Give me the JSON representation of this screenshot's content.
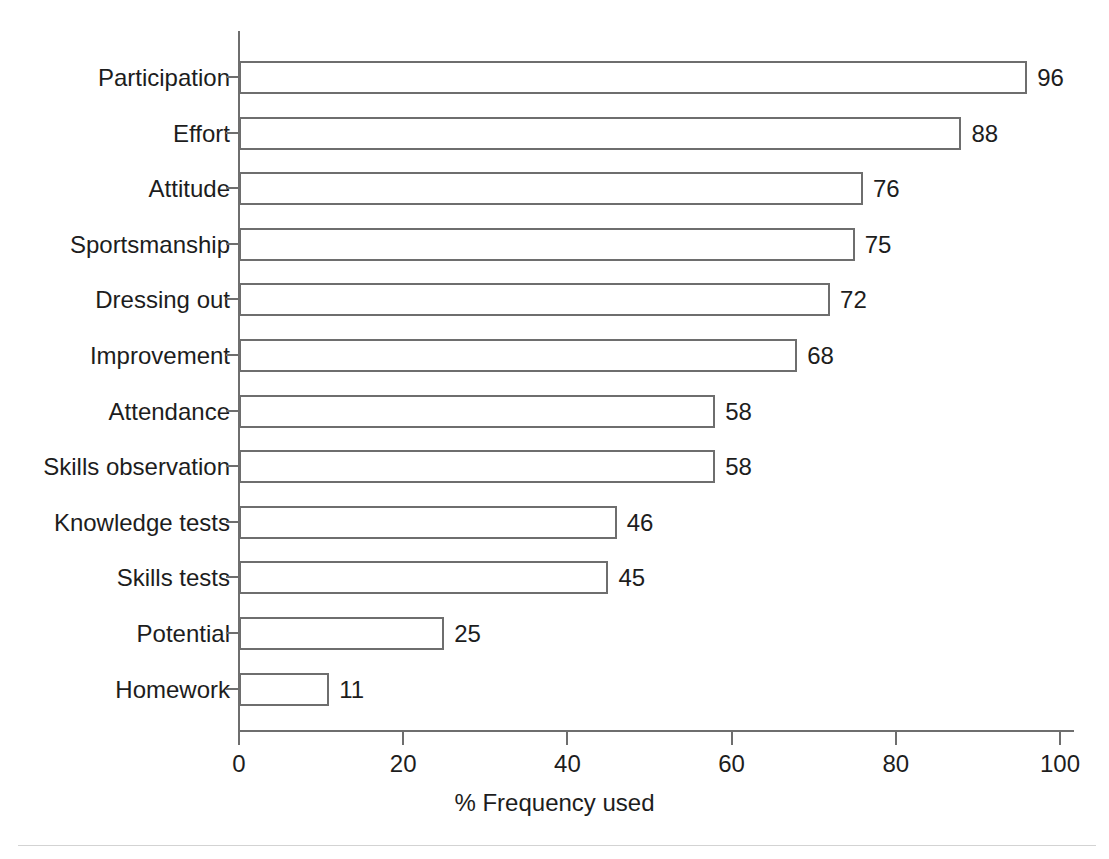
{
  "chart_data": {
    "type": "bar",
    "orientation": "horizontal",
    "title": "",
    "subtitle": "",
    "xlabel": "% Frequency used",
    "ylabel": "",
    "xlim": [
      0,
      100
    ],
    "xticks": [
      0,
      20,
      40,
      60,
      80,
      100
    ],
    "xtick_labels": [
      "0",
      "20",
      "40",
      "60",
      "80",
      "100"
    ],
    "grid": false,
    "legend": false,
    "legend_position": "none",
    "categories": [
      "Participation",
      "Effort",
      "Attitude",
      "Sportsmanship",
      "Dressing out",
      "Improvement",
      "Attendance",
      "Skills observation",
      "Knowledge tests",
      "Skills tests",
      "Potential",
      "Homework"
    ],
    "values": [
      96,
      88,
      76,
      75,
      72,
      68,
      58,
      58,
      46,
      45,
      25,
      11
    ],
    "value_labels": [
      "96",
      "88",
      "76",
      "75",
      "72",
      "68",
      "58",
      "58",
      "46",
      "45",
      "25",
      "11"
    ],
    "series": [
      {
        "name": "% Frequency used",
        "values": [
          96,
          88,
          76,
          75,
          72,
          68,
          58,
          58,
          46,
          45,
          25,
          11
        ]
      }
    ],
    "colors": {
      "bar_fill": "#ffffff",
      "bar_stroke": "#6e6e6e",
      "axis": "#6e6e6e",
      "text": "#1d1d1d",
      "background": "#ffffff"
    }
  }
}
